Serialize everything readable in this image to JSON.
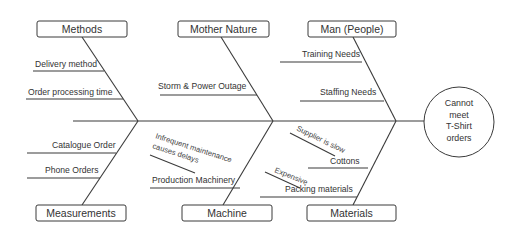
{
  "effect": {
    "lines": [
      "Cannot",
      "meet",
      "T-Shirt",
      "orders"
    ]
  },
  "categories": {
    "methods": {
      "label": "Methods",
      "causes": [
        "Delivery method",
        "Order processing time"
      ]
    },
    "mother_nature": {
      "label": "Mother Nature",
      "causes": [
        "Storm & Power Outage"
      ]
    },
    "man": {
      "label": "Man (People)",
      "causes": [
        "Training Needs",
        "Staffing Needs"
      ]
    },
    "measurements": {
      "label": "Measurements",
      "causes": [
        "Catalogue  Order",
        "Phone Orders"
      ]
    },
    "machine": {
      "label": "Machine",
      "causes": [
        "Production Machinery"
      ],
      "subcauses": [
        "Infrequent maintenance",
        "causes delays"
      ]
    },
    "materials": {
      "label": "Materials",
      "causes": [
        "Cottons",
        "Packing materials"
      ],
      "subcauses": [
        "Supplier is slow",
        "Expensive"
      ]
    }
  },
  "colors": {
    "line": "#3a3a3a",
    "text": "#333333",
    "background": "#ffffff"
  }
}
